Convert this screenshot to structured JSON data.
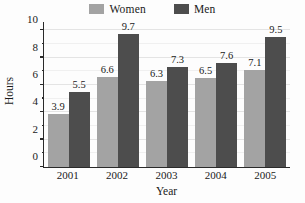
{
  "chart_data": {
    "type": "bar",
    "title": "",
    "xlabel": "Year",
    "ylabel": "Hours",
    "categories": [
      "2001",
      "2002",
      "2003",
      "2004",
      "2005"
    ],
    "series": [
      {
        "name": "Women",
        "values": [
          3.9,
          6.6,
          6.3,
          6.5,
          7.1
        ],
        "color": "#a3a3a3"
      },
      {
        "name": "Men",
        "values": [
          5.5,
          9.7,
          7.3,
          7.6,
          9.5
        ],
        "color": "#4d4d4d"
      }
    ],
    "ylim": [
      0,
      10.6
    ],
    "yticks": [
      0,
      2,
      4,
      6,
      8,
      10
    ],
    "ytick_labels": [
      "0",
      "2",
      "4",
      "6",
      "8",
      "10"
    ],
    "yminor_ticks": [
      1,
      3,
      5,
      7,
      9
    ],
    "grid": true,
    "legend_position": "top-center",
    "data_labels": true
  },
  "legend": {
    "entries": [
      {
        "label": "Women",
        "swatch": "legend-swatch-women"
      },
      {
        "label": "Men",
        "swatch": "legend-swatch-men"
      }
    ]
  },
  "colors": {
    "women": "#a3a3a3",
    "men": "#4d4d4d",
    "axis": "#2a2a2a",
    "grid": "#e4e4e4",
    "background": "#fdfdfd"
  }
}
